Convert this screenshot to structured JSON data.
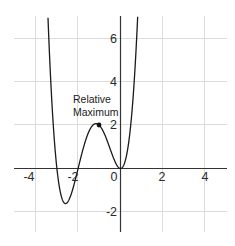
{
  "chart_data": {
    "type": "line",
    "title": "",
    "xlabel": "",
    "ylabel": "",
    "xlim": [
      -5,
      5
    ],
    "ylim": [
      -3.5,
      7.5
    ],
    "grid": true,
    "x_ticks": [
      -4,
      -2,
      0,
      2,
      4
    ],
    "y_ticks": [
      -2,
      2,
      4,
      6
    ],
    "x_tick_labels": [
      "-4",
      "-2",
      "0",
      "2",
      "4"
    ],
    "y_tick_labels": [
      "-2",
      "2",
      "4",
      "6"
    ],
    "series": [
      {
        "name": "f(x) = x^2(x+2)(x+3)",
        "x": [
          -3.8,
          -3.5,
          -3.0,
          -2.8,
          -2.6,
          -2.5,
          -2.2,
          -2.0,
          -1.5,
          -1.0,
          -0.5,
          0.0,
          0.5,
          0.8
        ],
        "y": [
          8.8,
          -2.2,
          0.0,
          -1.3,
          -1.62,
          -1.56,
          -0.77,
          0.0,
          1.69,
          2.0,
          0.94,
          0.0,
          2.19,
          4.79
        ],
        "color": "#1a1a1a"
      }
    ],
    "annotations": [
      {
        "text": "Relative Maximum",
        "x": -1,
        "y": 2,
        "marker": "dot"
      }
    ]
  },
  "annotation": {
    "line1": "Relative",
    "line2": "Maximum"
  },
  "ticks": {
    "x": [
      "-4",
      "-2",
      "0",
      "2",
      "4"
    ],
    "y": [
      "6",
      "4",
      "2",
      "-2"
    ]
  }
}
